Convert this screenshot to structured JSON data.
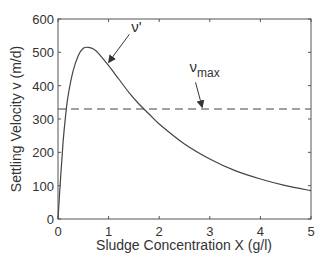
{
  "chart_data": {
    "type": "line",
    "title": "",
    "xlabel": "Sludge Concentration X (g/l)",
    "ylabel": "Settling Velocity v (m/d)",
    "xlim": [
      0,
      5
    ],
    "ylim": [
      0,
      600
    ],
    "xticks": [
      0,
      1,
      2,
      3,
      4,
      5
    ],
    "yticks": [
      0,
      100,
      200,
      300,
      400,
      500,
      600
    ],
    "grid": false,
    "series": [
      {
        "name": "v'",
        "style": "solid",
        "x": [
          0,
          0.05,
          0.1,
          0.15,
          0.2,
          0.3,
          0.4,
          0.5,
          0.6,
          0.7,
          0.8,
          1.0,
          1.2,
          1.4,
          1.6,
          1.8,
          2.0,
          2.5,
          3.0,
          3.5,
          4.0,
          4.5,
          5.0
        ],
        "values": [
          0,
          120,
          230,
          310,
          370,
          445,
          490,
          512,
          515,
          510,
          497,
          460,
          420,
          380,
          345,
          315,
          285,
          225,
          180,
          145,
          120,
          100,
          85
        ]
      },
      {
        "name": "v_max",
        "style": "dashed",
        "x": [
          0,
          5
        ],
        "values": [
          330,
          330
        ]
      }
    ],
    "annotations": [
      {
        "text": "ν'",
        "x": 1.45,
        "y": 560,
        "arrow_to": [
          1.0,
          470
        ]
      },
      {
        "text": "ν",
        "subscript": "max",
        "x": 2.6,
        "y": 440,
        "arrow_to": [
          2.85,
          335
        ]
      }
    ]
  }
}
